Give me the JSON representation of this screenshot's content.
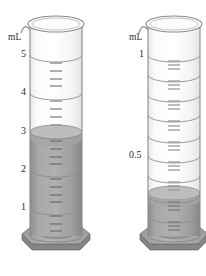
{
  "figure": {
    "title": "",
    "type": "graduated-cylinder-illustration",
    "background_color": "#ffffff"
  },
  "colors": {
    "glass_outline": "#8a8a8a",
    "glass_body": "#fafafa",
    "liquid_fill": "#a3a3a3",
    "liquid_surface": "#b4b4b4",
    "liquid_dark": "#8f8f8f",
    "base_top": "#a6a6a6",
    "base_side": "#8c8c8c",
    "base_outline": "#6e6e6e",
    "tick_mark": "#9a9a9a",
    "graduation_line": "#8f8f8f",
    "label_text": "#2b2b2b"
  },
  "cylinders": [
    {
      "id": "left-cylinder",
      "name": "left-graduated-cylinder",
      "units_label": "mL",
      "units_label_x": 11,
      "units_label_y": 38,
      "capacity": 5,
      "liquid_level": 3,
      "liquid_level_y": 132,
      "geometry": {
        "rim_left": 30,
        "rim_right": 82,
        "rim_top": 17,
        "body_top": 24,
        "body_bottom": 240,
        "base_y": 236,
        "base_left": 22,
        "base_right": 90
      },
      "tick_labels": [
        {
          "text": "5",
          "value": 5,
          "x": 26,
          "y": 55
        },
        {
          "text": "4",
          "value": 4,
          "x": 26,
          "y": 93
        },
        {
          "text": "3",
          "value": 3,
          "x": 26,
          "y": 132
        },
        {
          "text": "2",
          "value": 2,
          "x": 26,
          "y": 170
        },
        {
          "text": "1",
          "value": 1,
          "x": 26,
          "y": 208
        }
      ],
      "graduation_lines_y": [
        55,
        93,
        132,
        170,
        208
      ],
      "minor_ticks_per_band": 4
    },
    {
      "id": "right-cylinder",
      "name": "right-graduated-cylinder",
      "units_label": "mL",
      "units_label_x": 129,
      "units_label_y": 38,
      "capacity": 1,
      "liquid_level": 0.3,
      "liquid_level_y": 193,
      "geometry": {
        "rim_left": 148,
        "rim_right": 200,
        "rim_top": 17,
        "body_top": 24,
        "body_bottom": 240,
        "base_y": 236,
        "base_left": 140,
        "base_right": 206
      },
      "tick_labels": [
        {
          "text": "1",
          "value": 1,
          "x": 141,
          "y": 55
        },
        {
          "text": "0.5",
          "value": 0.5,
          "x": 132,
          "y": 156
        }
      ],
      "graduation_lines_y": [
        55,
        75,
        95,
        115,
        136,
        156,
        176,
        196,
        216
      ],
      "minor_ticks_per_band": 4
    }
  ]
}
